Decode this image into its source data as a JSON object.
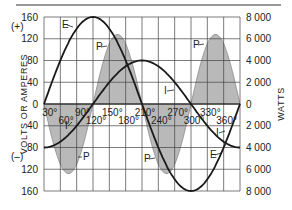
{
  "chart_data": {
    "type": "line",
    "title": "",
    "xlabel": "",
    "ylabel": "VOLTS OR AMPERES",
    "y2label": "WATTS",
    "left_axis": {
      "ticks": [
        160,
        120,
        80,
        40,
        0,
        40,
        80,
        120,
        160
      ],
      "tick_labels": [
        "160",
        "120",
        "80",
        "40",
        "0",
        "40",
        "80",
        "120",
        "160"
      ],
      "sign_labels": {
        "positive": "(+)",
        "negative": "(–)"
      },
      "range": [
        -160,
        160
      ]
    },
    "right_axis": {
      "tick_labels": [
        "8 000",
        "6 000",
        "4 000",
        "2 000",
        "0",
        "2 000",
        "4 000",
        "6 000",
        "8 000"
      ],
      "range": [
        -8000,
        8000
      ]
    },
    "x_axis": {
      "tick_labels": [
        "30°",
        "60°",
        "90°",
        "120°",
        "150°",
        "180°",
        "210°",
        "240°",
        "270°",
        "300°",
        "330°",
        "360°"
      ],
      "range_deg": [
        0,
        360
      ]
    },
    "grid": true,
    "series": [
      {
        "name": "E",
        "description": "Voltage, 160 V peak, sine starting at 0°",
        "x_deg": [
          0,
          30,
          60,
          90,
          120,
          150,
          180,
          210,
          240,
          270,
          300,
          330,
          360
        ],
        "values": [
          0,
          80,
          139,
          160,
          139,
          80,
          0,
          -80,
          -139,
          -160,
          -139,
          -80,
          0
        ]
      },
      {
        "name": "I",
        "description": "Current, 80 A peak, lagging E by 90°",
        "x_deg": [
          0,
          30,
          60,
          90,
          120,
          150,
          180,
          210,
          240,
          270,
          300,
          330,
          360
        ],
        "values": [
          -80,
          -69,
          -40,
          0,
          40,
          69,
          80,
          69,
          40,
          0,
          -40,
          -69,
          -80
        ]
      },
      {
        "name": "P",
        "description": "Power (watts, shaded), product E×I",
        "x_deg": [
          0,
          30,
          45,
          60,
          90,
          120,
          135,
          150,
          180,
          210,
          225,
          240,
          270,
          300,
          315,
          330,
          360
        ],
        "values": [
          0,
          -5540,
          -6400,
          -5540,
          0,
          5540,
          6400,
          5540,
          0,
          -5540,
          -6400,
          -5540,
          0,
          5540,
          6400,
          5540,
          0
        ]
      }
    ],
    "annotations": [
      "E",
      "P",
      "P",
      "I",
      "I",
      "P",
      "P",
      "E"
    ]
  },
  "labels": {
    "y_title": "VOLTS OR AMPERES",
    "y2_title": "WATTS",
    "plus": "(+)",
    "minus": "(–)",
    "E": "E",
    "P": "P",
    "I": "I"
  }
}
